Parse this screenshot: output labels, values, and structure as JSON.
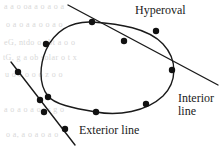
{
  "figure": {
    "background": "#ffffff",
    "ink_color": "#1a1a1a",
    "bleed_color": "#d8d8d8",
    "width": 224,
    "height": 149
  },
  "labels": {
    "hyperoval": "Hyperoval",
    "interior_line_1": "Interior",
    "interior_line_2": "line",
    "exterior_line": "Exterior line"
  },
  "bleed_text": {
    "row1": "a a  o   oa    a   o    a  o   a",
    "row2": "o  a   o  a  a o     o a  o",
    "row3": "eG, ntdo  o gbt   a  o     o",
    "row4": "tG,  g  a  ob  solar   o  t  x",
    "row5": "u  o   a  o    o  o  z   o  o",
    "row6": "a  o  a   o  a   oa   s   g  o",
    "row7": "o   a,  a  o   a  o    a   o"
  },
  "chart_data": {
    "type": "diagram",
    "title": "Hyperoval",
    "oval": {
      "name": "hyperoval",
      "path": "M 92,22 C 120,24 148,28 163,44 C 178,60 177,82 163,96 C 146,112 118,116 96,112 C 72,108 54,104 48,96 C 38,84 40,64 46,50 C 54,32 70,21 92,22 Z",
      "stroke": "#1a1a1a",
      "stroke_width": 1.4,
      "fill": "none"
    },
    "interior_line": {
      "name": "interior-line",
      "x1": 68,
      "y1": 5,
      "x2": 218,
      "y2": 85,
      "stroke": "#1a1a1a",
      "stroke_width": 1.4,
      "relation_to_oval": "secant",
      "intersection_count": 2
    },
    "exterior_line": {
      "name": "exterior-line",
      "x1": 11,
      "y1": 62,
      "x2": 75,
      "y2": 145,
      "stroke": "#1a1a1a",
      "stroke_width": 1.4,
      "relation_to_oval": "disjoint",
      "intersection_count": 0
    },
    "points": [
      {
        "id": "p1",
        "x": 92,
        "y": 22,
        "on": [
          "oval",
          "interior_line"
        ],
        "role": "intersection"
      },
      {
        "id": "p2",
        "x": 156,
        "y": 31,
        "on": [
          "oval"
        ],
        "role": "oval-point"
      },
      {
        "id": "p3",
        "x": 172,
        "y": 70,
        "on": [
          "oval",
          "interior_line"
        ],
        "role": "intersection"
      },
      {
        "id": "p4",
        "x": 146,
        "y": 104,
        "on": [
          "oval"
        ],
        "role": "oval-point"
      },
      {
        "id": "p5",
        "x": 96,
        "y": 112,
        "on": [
          "oval"
        ],
        "role": "oval-point"
      },
      {
        "id": "p6",
        "x": 48,
        "y": 97,
        "on": [
          "oval"
        ],
        "role": "oval-point"
      },
      {
        "id": "p7",
        "x": 46,
        "y": 44,
        "on": [
          "oval"
        ],
        "role": "oval-point"
      },
      {
        "id": "p8",
        "x": 124,
        "y": 41,
        "on": [
          "interior_line"
        ],
        "role": "interior-line-point"
      },
      {
        "id": "p9",
        "x": 18,
        "y": 72,
        "on": [
          "exterior_line"
        ],
        "role": "exterior-line-point"
      },
      {
        "id": "p10",
        "x": 40,
        "y": 100,
        "on": [
          "exterior_line"
        ],
        "role": "exterior-line-point"
      },
      {
        "id": "p11",
        "x": 44,
        "y": 112,
        "on": [
          "exterior_line"
        ],
        "role": "exterior-line-point"
      },
      {
        "id": "p12",
        "x": 65,
        "y": 129,
        "on": [
          "exterior_line"
        ],
        "role": "exterior-line-point"
      }
    ],
    "point_style": {
      "radius": 3.2,
      "fill": "#111111"
    }
  }
}
